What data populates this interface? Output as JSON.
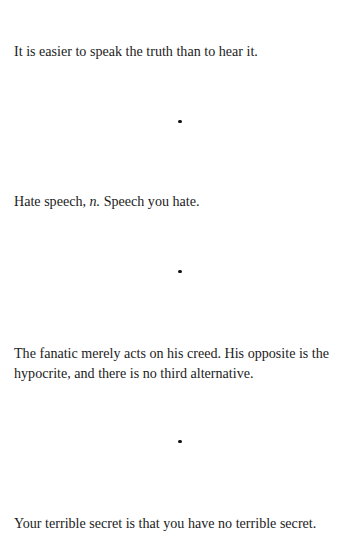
{
  "page": {
    "background_color": "#ffffff",
    "text_color": "#1c1c1c",
    "running_header": "▉▉ ▉▉▉"
  },
  "divider": {
    "glyph": "•",
    "count": 3,
    "color": "#141414"
  },
  "entries": [
    {
      "id": "aphorism-truth",
      "text": "It is easier to speak the truth than to hear it."
    },
    {
      "id": "aphorism-hate-speech",
      "lead": "Hate speech,",
      "pos_abbrev": "n.",
      "definition": "Speech you hate."
    },
    {
      "id": "aphorism-fanatic",
      "text": "The fanatic merely acts on his creed. His opposite is the hypocrite, and there is no third alternative."
    },
    {
      "id": "aphorism-terrible-secret",
      "text": "Your terrible secret is that you have no terrible secret."
    }
  ]
}
